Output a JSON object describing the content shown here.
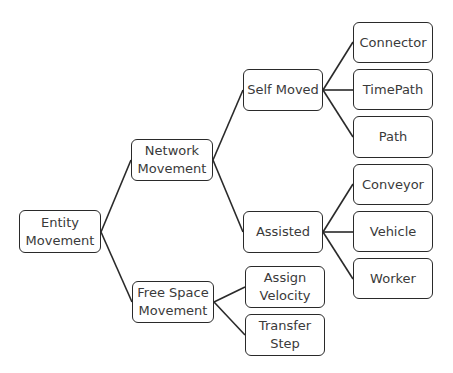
{
  "diagram": {
    "type": "tree",
    "colors": {
      "border": "#2a2a2a",
      "text": "#3a3a3a",
      "background": "#ffffff"
    },
    "nodes": {
      "entity_movement": {
        "label": "Entity\nMovement",
        "x": 19,
        "y": 210,
        "w": 82,
        "h": 43
      },
      "network_movement": {
        "label": "Network\nMovement",
        "x": 131,
        "y": 139,
        "w": 82,
        "h": 42
      },
      "free_space_movement": {
        "label": "Free Space\nMovement",
        "x": 132,
        "y": 281,
        "w": 82,
        "h": 42
      },
      "self_moved": {
        "label": "Self Moved",
        "x": 243,
        "y": 69,
        "w": 80,
        "h": 42
      },
      "assisted": {
        "label": "Assisted",
        "x": 243,
        "y": 211,
        "w": 80,
        "h": 42
      },
      "assign_velocity": {
        "label": "Assign\nVelocity",
        "x": 245,
        "y": 266,
        "w": 80,
        "h": 42
      },
      "transfer_step": {
        "label": "Transfer\nStep",
        "x": 245,
        "y": 314,
        "w": 80,
        "h": 42
      },
      "connector": {
        "label": "Connector",
        "x": 353,
        "y": 22,
        "w": 80,
        "h": 41
      },
      "timepath": {
        "label": "TimePath",
        "x": 353,
        "y": 69,
        "w": 80,
        "h": 41
      },
      "path": {
        "label": "Path",
        "x": 353,
        "y": 116,
        "w": 80,
        "h": 42
      },
      "conveyor": {
        "label": "Conveyor",
        "x": 353,
        "y": 164,
        "w": 80,
        "h": 41
      },
      "vehicle": {
        "label": "Vehicle",
        "x": 353,
        "y": 211,
        "w": 80,
        "h": 41
      },
      "worker": {
        "label": "Worker",
        "x": 353,
        "y": 258,
        "w": 80,
        "h": 41
      }
    },
    "edges": [
      {
        "from": "entity_movement",
        "to": "network_movement"
      },
      {
        "from": "entity_movement",
        "to": "free_space_movement"
      },
      {
        "from": "network_movement",
        "to": "self_moved"
      },
      {
        "from": "network_movement",
        "to": "assisted"
      },
      {
        "from": "free_space_movement",
        "to": "assign_velocity"
      },
      {
        "from": "free_space_movement",
        "to": "transfer_step"
      },
      {
        "from": "self_moved",
        "to": "connector"
      },
      {
        "from": "self_moved",
        "to": "timepath"
      },
      {
        "from": "self_moved",
        "to": "path"
      },
      {
        "from": "assisted",
        "to": "conveyor"
      },
      {
        "from": "assisted",
        "to": "vehicle"
      },
      {
        "from": "assisted",
        "to": "worker"
      }
    ]
  }
}
